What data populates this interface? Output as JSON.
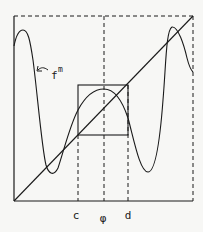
{
  "figure": {
    "type": "renormalization-diagram",
    "curve_label": "f",
    "curve_superscript": "m",
    "x_labels": [
      {
        "id": "c",
        "text": "c"
      },
      {
        "id": "phi",
        "text": "φ"
      },
      {
        "id": "d",
        "text": "d"
      }
    ],
    "colors": {
      "ink": "#1a1a1a",
      "paper": "#f7f7f5"
    }
  }
}
